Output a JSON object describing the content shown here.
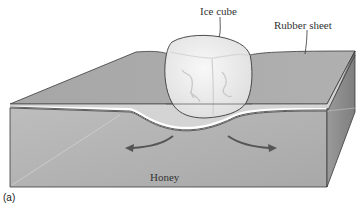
{
  "figure": {
    "panel_label": "(a)",
    "labels": {
      "ice_cube": "Ice cube",
      "rubber_sheet": "Rubber sheet",
      "honey": "Honey"
    },
    "colors": {
      "top_face": "#a9a9a9",
      "front_face": "#b4b4b4",
      "right_face": "#8f8f8f",
      "sheet_edge": "#d6d6d6",
      "outline": "#3a3a3a",
      "ice_cube": "#eeeeee",
      "arrow": "#555555"
    },
    "arrows": [
      "flow-left",
      "flow-right"
    ]
  }
}
